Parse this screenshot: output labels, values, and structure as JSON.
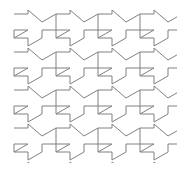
{
  "figure": {
    "type": "tessellation",
    "canvas": {
      "width": 194,
      "height": 175,
      "background_color": "#ffffff"
    },
    "stroke": {
      "color": "#808080",
      "width": 1
    },
    "lattice": {
      "period_x": 42,
      "period_y": 38,
      "origin_x": 14,
      "origin_y": 10,
      "columns": 5,
      "rows": 5,
      "clip_left": 12,
      "clip_top": 6,
      "clip_right": 177,
      "clip_bottom": 163
    },
    "tile": {
      "name": "interlocking-arrow-tile",
      "vertex_count": 12,
      "outline": [
        [
          0,
          4
        ],
        [
          14,
          4
        ],
        [
          14,
          0
        ],
        [
          28,
          12
        ],
        [
          42,
          4
        ],
        [
          42,
          20
        ],
        [
          28,
          20
        ],
        [
          28,
          28
        ],
        [
          14,
          36
        ],
        [
          14,
          28
        ],
        [
          0,
          28
        ],
        [
          0,
          20
        ],
        [
          14,
          20
        ],
        [
          0,
          28
        ]
      ],
      "outline_simple": [
        [
          0,
          4
        ],
        [
          14,
          4
        ],
        [
          14,
          0
        ],
        [
          28,
          12
        ],
        [
          42,
          4
        ],
        [
          42,
          20
        ],
        [
          28,
          20
        ],
        [
          28,
          28
        ],
        [
          14,
          36
        ],
        [
          14,
          28
        ],
        [
          0,
          28
        ]
      ]
    }
  }
}
